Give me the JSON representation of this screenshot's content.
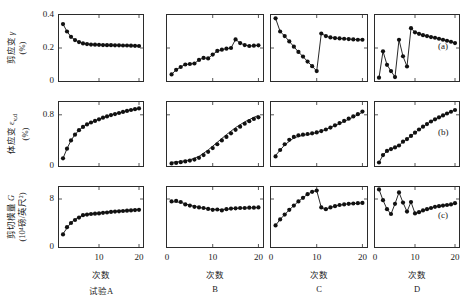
{
  "figure": {
    "rows": [
      {
        "key": "a",
        "caption": "(a)",
        "ylabel_line1": "剪应变 γ",
        "ylabel_line2": "(%)",
        "yticks": [
          "0",
          "0.2",
          "0.4"
        ],
        "ylim": [
          0,
          0.4
        ]
      },
      {
        "key": "b",
        "caption": "(b)",
        "ylabel_line1": "体应变 εv,d",
        "ylabel_line2": "(%)",
        "yticks": [
          "0",
          "0.8"
        ],
        "ylim": [
          0,
          1.0
        ]
      },
      {
        "key": "c",
        "caption": "(c)",
        "ylabel_line1": "剪切模量 G",
        "ylabel_line2": "(10⁴磅/英尺²)",
        "yticks": [
          "0",
          "8"
        ],
        "ylim": [
          0,
          10
        ]
      }
    ],
    "columns": [
      {
        "key": "A",
        "caption": "试验A",
        "xaxis_title": "次数",
        "xticks": [
          "10",
          "20"
        ],
        "xtick_values": [
          10,
          20
        ]
      },
      {
        "key": "B",
        "caption": "B",
        "xaxis_title": "次数",
        "xticks": [
          "0",
          "10",
          "20"
        ],
        "xtick_values": [
          0,
          10,
          20
        ]
      },
      {
        "key": "C",
        "caption": "C",
        "xaxis_title": "次数",
        "xticks": [
          "0",
          "10",
          "20"
        ],
        "xtick_values": [
          0,
          10,
          20
        ]
      },
      {
        "key": "D",
        "caption": "D",
        "xaxis_title": "次数",
        "xticks": [
          "0",
          "10",
          "20"
        ],
        "xtick_values": [
          0,
          10,
          20
        ]
      }
    ]
  },
  "chart_data": [
    {
      "id": "a-A",
      "type": "line",
      "row": "a",
      "column": "A",
      "title": "",
      "xlabel": "次数",
      "ylabel": "剪应变 γ (%)",
      "xlim": [
        0,
        21
      ],
      "ylim": [
        0,
        0.4
      ],
      "grid": false,
      "markers": true,
      "line": true,
      "x": [
        1,
        2,
        3,
        4,
        5,
        6,
        7,
        8,
        9,
        10,
        11,
        12,
        13,
        14,
        15,
        16,
        17,
        18,
        19,
        20
      ],
      "y": [
        0.345,
        0.3,
        0.268,
        0.248,
        0.236,
        0.228,
        0.224,
        0.221,
        0.22,
        0.219,
        0.218,
        0.217,
        0.217,
        0.216,
        0.216,
        0.215,
        0.215,
        0.214,
        0.213,
        0.212
      ]
    },
    {
      "id": "a-B",
      "type": "line",
      "row": "a",
      "column": "B",
      "title": "",
      "xlabel": "次数",
      "ylabel": "剪应变 γ (%)",
      "xlim": [
        0,
        21
      ],
      "ylim": [
        0,
        0.4
      ],
      "grid": false,
      "markers": true,
      "line": true,
      "x": [
        1,
        2,
        3,
        4,
        5,
        6,
        7,
        8,
        9,
        10,
        11,
        12,
        13,
        14,
        15,
        16,
        17,
        18,
        19,
        20
      ],
      "y": [
        0.04,
        0.068,
        0.085,
        0.1,
        0.103,
        0.106,
        0.128,
        0.14,
        0.137,
        0.16,
        0.182,
        0.19,
        0.196,
        0.2,
        0.252,
        0.23,
        0.218,
        0.212,
        0.214,
        0.216
      ]
    },
    {
      "id": "a-C",
      "type": "line",
      "row": "a",
      "column": "C",
      "title": "",
      "xlabel": "次数",
      "ylabel": "剪应变 γ (%)",
      "xlim": [
        0,
        21
      ],
      "ylim": [
        0,
        0.4
      ],
      "grid": false,
      "markers": true,
      "line": true,
      "x": [
        1,
        2,
        3,
        4,
        5,
        6,
        7,
        8,
        9,
        10,
        11,
        12,
        13,
        14,
        15,
        16,
        17,
        18,
        19,
        20
      ],
      "y": [
        0.38,
        0.3,
        0.272,
        0.24,
        0.208,
        0.176,
        0.148,
        0.118,
        0.09,
        0.06,
        0.288,
        0.272,
        0.264,
        0.26,
        0.258,
        0.256,
        0.254,
        0.252,
        0.25,
        0.25
      ]
    },
    {
      "id": "a-D",
      "type": "line",
      "row": "a",
      "column": "D",
      "title": "",
      "xlabel": "次数",
      "ylabel": "剪应变 γ (%)",
      "xlim": [
        0,
        21
      ],
      "ylim": [
        0,
        0.4
      ],
      "grid": false,
      "markers": true,
      "line": true,
      "x": [
        1,
        2,
        3,
        4,
        5,
        6,
        7,
        8,
        9,
        10,
        11,
        12,
        13,
        14,
        15,
        16,
        17,
        18,
        19,
        20
      ],
      "y": [
        0.02,
        0.18,
        0.098,
        0.06,
        0.024,
        0.25,
        0.15,
        0.088,
        0.32,
        0.295,
        0.286,
        0.278,
        0.272,
        0.266,
        0.262,
        0.256,
        0.25,
        0.244,
        0.238,
        0.23
      ]
    },
    {
      "id": "b-A",
      "type": "line",
      "row": "b",
      "column": "A",
      "title": "",
      "xlabel": "次数",
      "ylabel": "体应变 εv,d (%)",
      "xlim": [
        0,
        21
      ],
      "ylim": [
        0,
        1.0
      ],
      "grid": false,
      "markers": true,
      "line": true,
      "x": [
        1,
        2,
        3,
        4,
        5,
        6,
        7,
        8,
        9,
        10,
        11,
        12,
        13,
        14,
        15,
        16,
        17,
        18,
        19,
        20
      ],
      "y": [
        0.12,
        0.27,
        0.4,
        0.49,
        0.56,
        0.61,
        0.65,
        0.68,
        0.705,
        0.73,
        0.755,
        0.775,
        0.795,
        0.812,
        0.828,
        0.845,
        0.86,
        0.875,
        0.888,
        0.9
      ]
    },
    {
      "id": "b-B",
      "type": "line",
      "row": "b",
      "column": "B",
      "title": "",
      "xlabel": "次数",
      "ylabel": "体应变 εv,d (%)",
      "xlim": [
        0,
        21
      ],
      "ylim": [
        0,
        1.0
      ],
      "grid": false,
      "markers": true,
      "line": true,
      "x": [
        1,
        2,
        3,
        4,
        5,
        6,
        7,
        8,
        9,
        10,
        11,
        12,
        13,
        14,
        15,
        16,
        17,
        18,
        19,
        20
      ],
      "y": [
        0.04,
        0.048,
        0.06,
        0.072,
        0.085,
        0.1,
        0.128,
        0.17,
        0.222,
        0.28,
        0.34,
        0.4,
        0.455,
        0.51,
        0.565,
        0.615,
        0.66,
        0.7,
        0.735,
        0.76
      ],
      "trend_line": {
        "x": [
          1,
          3,
          5,
          7,
          9,
          11,
          13,
          15,
          17,
          19,
          20
        ],
        "y": [
          0.055,
          0.07,
          0.095,
          0.15,
          0.25,
          0.37,
          0.49,
          0.6,
          0.69,
          0.76,
          0.79
        ]
      }
    },
    {
      "id": "b-C",
      "type": "line",
      "row": "b",
      "column": "C",
      "title": "",
      "xlabel": "次数",
      "ylabel": "体应变 εv,d (%)",
      "xlim": [
        0,
        21
      ],
      "ylim": [
        0,
        1.0
      ],
      "grid": false,
      "markers": true,
      "line": true,
      "x": [
        1,
        2,
        3,
        4,
        5,
        6,
        7,
        8,
        9,
        10,
        11,
        12,
        13,
        14,
        15,
        16,
        17,
        18,
        19,
        20
      ],
      "y": [
        0.15,
        0.25,
        0.34,
        0.41,
        0.455,
        0.48,
        0.49,
        0.5,
        0.51,
        0.525,
        0.545,
        0.57,
        0.6,
        0.635,
        0.67,
        0.705,
        0.74,
        0.775,
        0.81,
        0.85
      ],
      "trend_line": {
        "x": [
          1,
          3,
          5,
          7,
          9,
          11,
          13,
          15,
          17,
          19,
          20
        ],
        "y": [
          0.165,
          0.33,
          0.44,
          0.48,
          0.505,
          0.545,
          0.6,
          0.665,
          0.73,
          0.8,
          0.84
        ]
      }
    },
    {
      "id": "b-D",
      "type": "line",
      "row": "b",
      "column": "D",
      "title": "",
      "xlabel": "次数",
      "ylabel": "体应变 εv,d (%)",
      "xlim": [
        0,
        21
      ],
      "ylim": [
        0,
        1.0
      ],
      "grid": false,
      "markers": true,
      "line": true,
      "x": [
        1,
        2,
        3,
        4,
        5,
        6,
        7,
        8,
        9,
        10,
        11,
        12,
        13,
        14,
        15,
        16,
        17,
        18,
        19,
        20
      ],
      "y": [
        0.055,
        0.17,
        0.235,
        0.265,
        0.29,
        0.32,
        0.38,
        0.42,
        0.47,
        0.52,
        0.57,
        0.615,
        0.655,
        0.695,
        0.73,
        0.76,
        0.79,
        0.82,
        0.848,
        0.875
      ]
    },
    {
      "id": "c-A",
      "type": "line",
      "row": "c",
      "column": "A",
      "title": "",
      "xlabel": "次数",
      "ylabel": "剪切模量 G (10⁴磅/英尺²)",
      "xlim": [
        0,
        21
      ],
      "ylim": [
        0,
        10
      ],
      "grid": false,
      "markers": true,
      "line": true,
      "x": [
        1,
        2,
        3,
        4,
        5,
        6,
        7,
        8,
        9,
        10,
        11,
        12,
        13,
        14,
        15,
        16,
        17,
        18,
        19,
        20
      ],
      "y": [
        2.1,
        3.3,
        4.0,
        4.5,
        4.9,
        5.3,
        5.4,
        5.5,
        5.55,
        5.6,
        5.7,
        5.75,
        5.85,
        5.9,
        5.95,
        6.0,
        6.05,
        6.1,
        6.15,
        6.2
      ],
      "trend_line": {
        "x": [
          1,
          3,
          5,
          7,
          9,
          11,
          13,
          15,
          17,
          19,
          20
        ],
        "y": [
          2.2,
          4.1,
          5.0,
          5.45,
          5.6,
          5.75,
          5.9,
          6.0,
          6.1,
          6.2,
          6.25
        ]
      }
    },
    {
      "id": "c-B",
      "type": "line",
      "row": "c",
      "column": "B",
      "title": "",
      "xlabel": "次数",
      "ylabel": "剪切模量 G (10⁴磅/英尺²)",
      "xlim": [
        0,
        21
      ],
      "ylim": [
        0,
        10
      ],
      "grid": false,
      "markers": true,
      "line": true,
      "x": [
        1,
        2,
        3,
        4,
        5,
        6,
        7,
        8,
        9,
        10,
        11,
        12,
        13,
        14,
        15,
        16,
        17,
        18,
        19,
        20
      ],
      "y": [
        7.6,
        7.7,
        7.5,
        7.1,
        6.9,
        6.7,
        6.6,
        6.5,
        6.35,
        6.2,
        6.25,
        6.1,
        6.3,
        6.4,
        6.45,
        6.5,
        6.5,
        6.55,
        6.55,
        6.6
      ],
      "trend_line": {
        "x": [
          1,
          3,
          5,
          7,
          9,
          11,
          13,
          15,
          17,
          19,
          20
        ],
        "y": [
          7.55,
          7.45,
          6.95,
          6.6,
          6.35,
          6.2,
          6.3,
          6.45,
          6.5,
          6.55,
          6.58
        ]
      }
    },
    {
      "id": "c-C",
      "type": "line",
      "row": "c",
      "column": "C",
      "title": "",
      "xlabel": "次数",
      "ylabel": "剪切模量 G (10⁴磅/英尺²)",
      "xlim": [
        0,
        21
      ],
      "ylim": [
        0,
        10
      ],
      "grid": false,
      "markers": true,
      "line": true,
      "x": [
        1,
        2,
        3,
        4,
        5,
        6,
        7,
        8,
        9,
        10,
        11,
        12,
        13,
        14,
        15,
        16,
        17,
        18,
        19,
        20
      ],
      "y": [
        3.6,
        4.6,
        5.4,
        6.2,
        6.9,
        7.6,
        8.2,
        8.8,
        9.2,
        9.4,
        6.6,
        6.3,
        6.6,
        6.8,
        7.0,
        7.1,
        7.2,
        7.25,
        7.3,
        7.35
      ]
    },
    {
      "id": "c-D",
      "type": "line",
      "row": "c",
      "column": "D",
      "title": "",
      "xlabel": "次数",
      "ylabel": "剪切模量 G (10⁴磅/英尺²)",
      "xlim": [
        0,
        21
      ],
      "ylim": [
        0,
        10
      ],
      "grid": false,
      "markers": true,
      "line": true,
      "x": [
        1,
        2,
        3,
        4,
        5,
        6,
        7,
        8,
        9,
        10,
        11,
        12,
        13,
        14,
        15,
        16,
        17,
        18,
        19,
        20
      ],
      "y": [
        9.6,
        7.8,
        6.3,
        5.5,
        7.2,
        9.1,
        7.4,
        5.9,
        7.5,
        5.6,
        5.8,
        6.1,
        6.3,
        6.5,
        6.7,
        6.8,
        6.9,
        7.0,
        7.1,
        7.3
      ]
    }
  ],
  "style": {
    "axis_color": "#2b2b2b",
    "data_color": "#111111",
    "marker_radius": 2.1,
    "line_width": 0.9
  }
}
